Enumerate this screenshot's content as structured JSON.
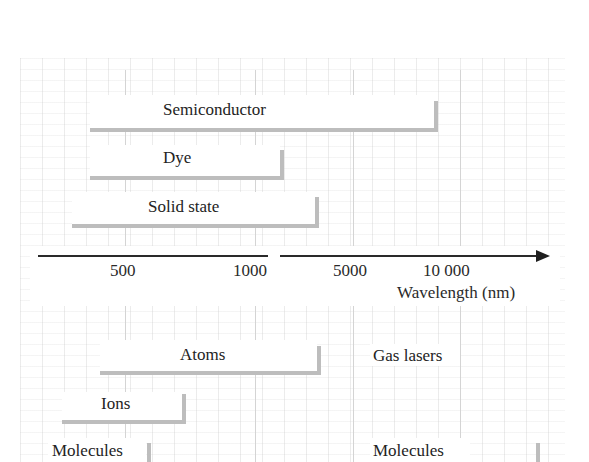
{
  "diagram": {
    "axis": {
      "label": "Wavelength (nm)",
      "ticks": [
        "500",
        "1000",
        "5000",
        "10 000"
      ],
      "note": "axis broken between 1000 and 5000"
    },
    "upper_groups": [
      {
        "label": "Semiconductor",
        "range_hint": "~400 nm to ~8000 nm"
      },
      {
        "label": "Dye",
        "range_hint": "~400 nm to ~1000 nm"
      },
      {
        "label": "Solid state",
        "range_hint": "~300 nm to ~3000 nm"
      }
    ],
    "lower_header": "Gas lasers",
    "lower_groups": [
      {
        "label": "Atoms",
        "range_hint": "~400 nm to ~3000 nm"
      },
      {
        "label": "Ions",
        "range_hint": "~250 nm to ~700 nm"
      },
      {
        "label": "Molecules",
        "range_hint": "UV to ~600 nm"
      },
      {
        "label": "Molecules",
        "range_hint": "up to ~10 000+ nm"
      }
    ],
    "colors": {
      "bar": "#bdbdbd",
      "axis": "#2a2a2a",
      "text": "#232323",
      "grid": "#d4d4d4"
    }
  }
}
